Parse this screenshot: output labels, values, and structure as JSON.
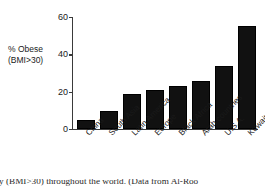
{
  "chart_data": {
    "type": "bar",
    "title": "",
    "xlabel": "",
    "ylabel": "% Obese (BMI>30)",
    "ylabel_line1": "% Obese",
    "ylabel_line2": "(BMI>30)",
    "categories": [
      "China",
      "South Asia",
      "Latin America",
      "Europe",
      "Black Africa",
      "Arab countries",
      "U.S.A.",
      "Kuwait"
    ],
    "values": [
      5,
      9.5,
      19,
      21,
      23,
      25.5,
      34,
      55
    ],
    "ylim": [
      0,
      60
    ],
    "yticks": [
      0,
      20,
      40,
      60
    ],
    "ytick_labels": [
      "0",
      "20",
      "40",
      "60"
    ],
    "grid": false,
    "legend": false,
    "bar_color": "#111111",
    "axis_color": "#3a3a3a",
    "xtick_rotation": -45
  },
  "caption": {
    "text": "ity (BMI>30) throughout the world.  (Data from Al-Roo"
  }
}
